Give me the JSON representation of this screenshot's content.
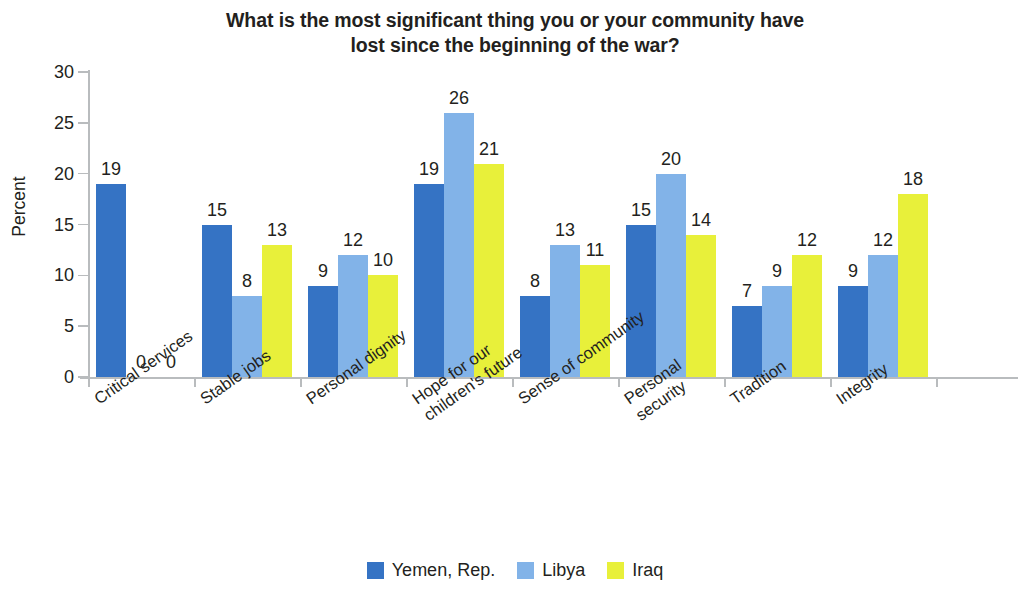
{
  "chart_data": {
    "type": "bar",
    "title": "What is the most significant thing you or your community have lost since the beginning of the war?",
    "title_lines": [
      "What is the most significant thing you or your community have",
      "lost since the beginning of the war?"
    ],
    "xlabel": "",
    "ylabel": "Percent",
    "ylim": [
      0,
      30
    ],
    "ytick_values": [
      0,
      5,
      10,
      15,
      20,
      25,
      30
    ],
    "ytick_labels": [
      "0",
      "5",
      "10",
      "15",
      "20",
      "25",
      "30"
    ],
    "grid": false,
    "legend_position": "bottom",
    "categories": [
      "Critical services",
      "Stable jobs",
      "Personal dignity",
      "Hope for our children's future",
      "Sense of community",
      "Personal security",
      "Tradition",
      "Integrity"
    ],
    "category_lines": [
      [
        "Critical services"
      ],
      [
        "Stable jobs"
      ],
      [
        "Personal dignity"
      ],
      [
        "Hope for our",
        "children's future"
      ],
      [
        "Sense of community"
      ],
      [
        "Personal",
        "security"
      ],
      [
        "Tradition"
      ],
      [
        "Integrity"
      ]
    ],
    "series": [
      {
        "name": "Yemen, Rep.",
        "color": "#3573c4",
        "values": [
          19,
          15,
          9,
          19,
          8,
          15,
          7,
          9
        ],
        "labels": [
          "19",
          "15",
          "9",
          "19",
          "8",
          "15",
          "7",
          "9"
        ]
      },
      {
        "name": "Libya",
        "color": "#82b3e8",
        "values": [
          0,
          8,
          12,
          26,
          13,
          20,
          9,
          12
        ],
        "labels": [
          "0",
          "8",
          "12",
          "26",
          "13",
          "20",
          "9",
          "12"
        ]
      },
      {
        "name": "Iraq",
        "color": "#e8f03a",
        "values": [
          0,
          13,
          10,
          21,
          11,
          14,
          12,
          18
        ],
        "labels": [
          "0",
          "13",
          "10",
          "21",
          "11",
          "14",
          "12",
          "18"
        ]
      }
    ]
  }
}
